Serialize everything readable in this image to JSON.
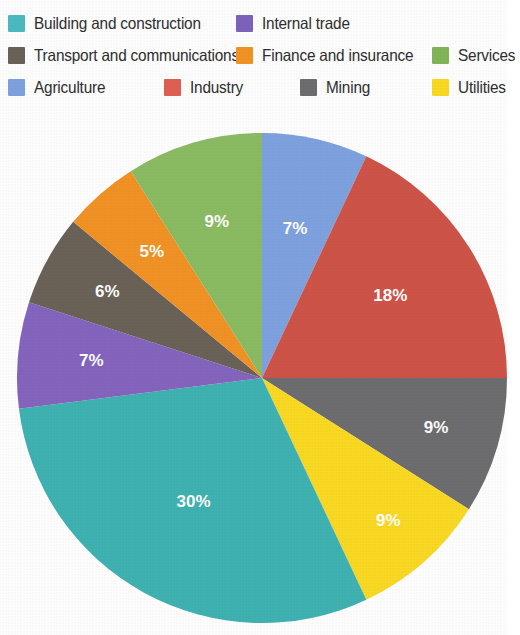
{
  "legend": {
    "rows": [
      [
        {
          "label": "Building and construction",
          "color": "#4cbbc0",
          "column": "a"
        },
        {
          "label": "Internal trade",
          "color": "#7e63bd",
          "column": "b"
        }
      ],
      [
        {
          "label": "Transport and communications",
          "color": "#6b6258",
          "column": "a"
        },
        {
          "label": "Finance and insurance",
          "color": "#f29325",
          "column": "b"
        },
        {
          "label": "Services",
          "color": "#82b65a",
          "column": "c"
        }
      ],
      [
        {
          "label": "Agriculture",
          "color": "#7fa2e0",
          "column": "a"
        },
        {
          "label": "Industry",
          "color": "#e06052",
          "column": "b"
        },
        {
          "label": "Mining",
          "color": "#6e6e70",
          "column": "c"
        },
        {
          "label": "Utilities",
          "color": "#fada23",
          "column": "c"
        }
      ]
    ]
  },
  "chart_data": {
    "type": "pie",
    "title": "",
    "legend_position": "top",
    "start_angle_deg": 0,
    "direction": "clockwise",
    "total": 100,
    "unit": "%",
    "categories": [
      "Agriculture",
      "Industry",
      "Mining",
      "Utilities",
      "Building and construction",
      "Internal trade",
      "Transport and communications",
      "Finance and insurance",
      "Services"
    ],
    "values": [
      7,
      18,
      9,
      9,
      30,
      7,
      6,
      5,
      9
    ],
    "labels": [
      "7%",
      "18%",
      "9%",
      "9%",
      "30%",
      "7%",
      "6%",
      "5%",
      "9%"
    ],
    "colors": [
      "#7fa2e0",
      "#cf5448",
      "#6e6e70",
      "#fada23",
      "#3fb3b2",
      "#8565be",
      "#6b6258",
      "#f29325",
      "#8bbc63"
    ],
    "slices": [
      {
        "name": "Agriculture",
        "value": 7,
        "label": "7%",
        "color": "#7fa2e0",
        "label_radius_frac": 0.62
      },
      {
        "name": "Industry",
        "value": 18,
        "label": "18%",
        "color": "#cf5448",
        "label_radius_frac": 0.62
      },
      {
        "name": "Mining",
        "value": 9,
        "label": "9%",
        "color": "#6e6e70",
        "label_radius_frac": 0.74
      },
      {
        "name": "Utilities",
        "value": 9,
        "label": "9%",
        "color": "#fada23",
        "label_radius_frac": 0.78
      },
      {
        "name": "Building and construction",
        "value": 30,
        "label": "30%",
        "color": "#3fb3b2",
        "label_radius_frac": 0.58
      },
      {
        "name": "Internal trade",
        "value": 7,
        "label": "7%",
        "color": "#8565be",
        "label_radius_frac": 0.7
      },
      {
        "name": "Transport and communications",
        "value": 6,
        "label": "6%",
        "color": "#6b6258",
        "label_radius_frac": 0.72
      },
      {
        "name": "Finance and insurance",
        "value": 5,
        "label": "5%",
        "color": "#f29325",
        "label_radius_frac": 0.68
      },
      {
        "name": "Services",
        "value": 9,
        "label": "9%",
        "color": "#8bbc63",
        "label_radius_frac": 0.66
      }
    ],
    "geometry": {
      "cx": 262,
      "cy": 270,
      "r": 245
    }
  }
}
